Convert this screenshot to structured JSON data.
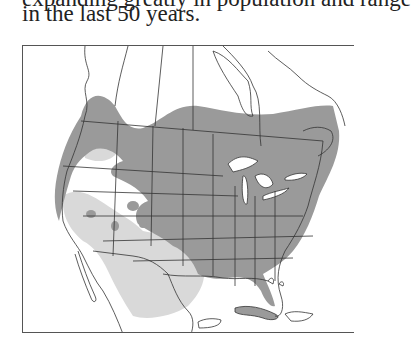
{
  "caption": {
    "line_cut": "expanding greatly in population and range",
    "line_last": "in the last 50 years."
  },
  "map": {
    "region": "North America (Canada, USA, Mexico, Caribbean)",
    "legend_colors": {
      "dark_range": "#9a9a9a",
      "light_range": "#d9d9d9",
      "land": "#ffffff",
      "water": "#ffffff",
      "borders": "#333333"
    }
  }
}
